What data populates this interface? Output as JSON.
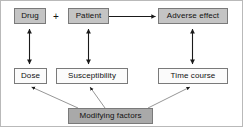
{
  "figure": {
    "operator_symbol": "+",
    "colors": {
      "node_fill_light": "#c4c4c4",
      "node_fill_dark": "#a9a9a9",
      "node_fill_plain": "#fbfbfb",
      "node_border": "#7a7a7a",
      "arrow": "#1a1a1a",
      "frame_border": "#b9b9b9",
      "background": "#ffffff"
    }
  },
  "nodes": {
    "drug": {
      "label": "Drug",
      "style": "filled",
      "row": "top"
    },
    "patient": {
      "label": "Patient",
      "style": "filled",
      "row": "top"
    },
    "adverse_effect": {
      "label": "Adverse effect",
      "style": "filled",
      "row": "top"
    },
    "dose": {
      "label": "Dose",
      "style": "plain",
      "row": "middle"
    },
    "susceptibility": {
      "label": "Susceptibility",
      "style": "plain",
      "row": "middle"
    },
    "time_course": {
      "label": "Time course",
      "style": "plain",
      "row": "middle"
    },
    "modifying_factors": {
      "label": "Modifying factors",
      "style": "filled-dark",
      "row": "bottom"
    }
  },
  "edges": [
    {
      "id": "patient-to-adverse-effect",
      "from": "patient",
      "to": "adverse_effect",
      "kind": "single-arrow",
      "orientation": "horizontal"
    },
    {
      "id": "drug-dose",
      "from": "drug",
      "to": "dose",
      "kind": "double-arrow",
      "orientation": "vertical"
    },
    {
      "id": "patient-susceptibility",
      "from": "patient",
      "to": "susceptibility",
      "kind": "double-arrow",
      "orientation": "vertical"
    },
    {
      "id": "adverse-effect-time-course",
      "from": "adverse_effect",
      "to": "time_course",
      "kind": "double-arrow",
      "orientation": "vertical"
    },
    {
      "id": "modifying-factors-dose",
      "from": "modifying_factors",
      "to": "dose",
      "kind": "single-arrow",
      "orientation": "diagonal"
    },
    {
      "id": "modifying-factors-susceptibility",
      "from": "modifying_factors",
      "to": "susceptibility",
      "kind": "single-arrow",
      "orientation": "diagonal"
    },
    {
      "id": "modifying-factors-time-course",
      "from": "modifying_factors",
      "to": "time_course",
      "kind": "single-arrow",
      "orientation": "diagonal"
    }
  ]
}
